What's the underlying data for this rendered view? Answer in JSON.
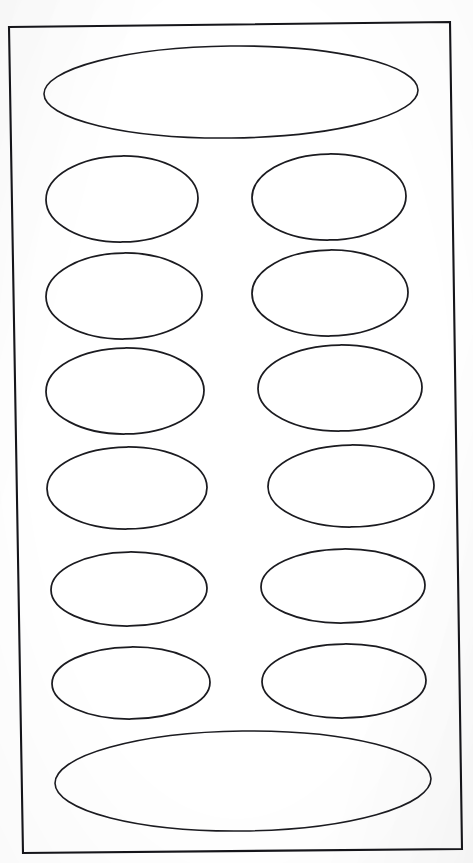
{
  "document": {
    "kind": "scanned-label-sheet",
    "title": "Blank Oval Label Sheet",
    "background_color": "#ffffff",
    "ink_color": "#1b1b20",
    "width": 473,
    "height": 863,
    "visible_text": ""
  },
  "frame": {
    "name": "sheet-border-rectangle",
    "stroke_color": "#15151a",
    "stroke_width": 2.1,
    "corners": {
      "top_left": [
        9,
        27
      ],
      "top_right": [
        450,
        22
      ],
      "bottom_right": [
        462,
        849
      ],
      "bottom_left": [
        23,
        853
      ]
    },
    "points": "9,27 450,22 462,849 23,853"
  },
  "layout": {
    "rows": 8,
    "columns_middle": 2,
    "total_ovals": 14,
    "full_width_ovals": 2,
    "half_width_ovals": 12
  },
  "ovals": [
    {
      "id": "oval-top-banner",
      "label": "top full-width oval",
      "cx": 231,
      "cy": 92,
      "rx": 187,
      "ry": 46,
      "rotate": -0.6,
      "span": "full"
    },
    {
      "id": "oval-r1-left",
      "label": "row 1 left oval",
      "cx": 122,
      "cy": 199,
      "rx": 76,
      "ry": 43,
      "rotate": -0.8,
      "span": "half"
    },
    {
      "id": "oval-r1-right",
      "label": "row 1 right oval",
      "cx": 329,
      "cy": 197,
      "rx": 77,
      "ry": 43,
      "rotate": -0.8,
      "span": "half"
    },
    {
      "id": "oval-r2-left",
      "label": "row 2 left oval",
      "cx": 124,
      "cy": 296,
      "rx": 78,
      "ry": 43,
      "rotate": -0.6,
      "span": "half"
    },
    {
      "id": "oval-r2-right",
      "label": "row 2 right oval",
      "cx": 330,
      "cy": 293,
      "rx": 78,
      "ry": 43,
      "rotate": -0.6,
      "span": "half"
    },
    {
      "id": "oval-r3-left",
      "label": "row 3 left oval",
      "cx": 125,
      "cy": 391,
      "rx": 79,
      "ry": 43,
      "rotate": -0.5,
      "span": "half"
    },
    {
      "id": "oval-r3-right",
      "label": "row 3 right oval",
      "cx": 340,
      "cy": 388,
      "rx": 82,
      "ry": 43,
      "rotate": -0.5,
      "span": "half"
    },
    {
      "id": "oval-r4-left",
      "label": "row 4 left oval",
      "cx": 127,
      "cy": 488,
      "rx": 80,
      "ry": 41,
      "rotate": -0.5,
      "span": "half"
    },
    {
      "id": "oval-r4-right",
      "label": "row 4 right oval",
      "cx": 351,
      "cy": 486,
      "rx": 83,
      "ry": 41,
      "rotate": -0.5,
      "span": "half"
    },
    {
      "id": "oval-r5-left",
      "label": "row 5 left oval",
      "cx": 129,
      "cy": 589,
      "rx": 78,
      "ry": 37,
      "rotate": -0.7,
      "span": "half"
    },
    {
      "id": "oval-r5-right",
      "label": "row 5 right oval",
      "cx": 343,
      "cy": 586,
      "rx": 82,
      "ry": 37,
      "rotate": -0.7,
      "span": "half"
    },
    {
      "id": "oval-r6-left",
      "label": "row 6 left oval",
      "cx": 131,
      "cy": 683,
      "rx": 79,
      "ry": 36,
      "rotate": -0.6,
      "span": "half"
    },
    {
      "id": "oval-r6-right",
      "label": "row 6 right oval",
      "cx": 344,
      "cy": 681,
      "rx": 82,
      "ry": 37,
      "rotate": -0.6,
      "span": "half"
    },
    {
      "id": "oval-bottom-banner",
      "label": "bottom full-width oval",
      "cx": 243,
      "cy": 781,
      "rx": 188,
      "ry": 50,
      "rotate": -0.7,
      "span": "full"
    }
  ]
}
